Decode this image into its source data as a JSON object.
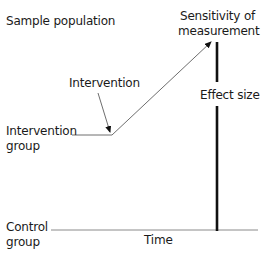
{
  "diagram": {
    "labels": {
      "sample_population": "Sample population",
      "sensitivity_line1": "Sensitivity of",
      "sensitivity_line2": "measurement",
      "intervention": "Intervention",
      "effect_size": "Effect size",
      "intervention_group_line1": "Intervention",
      "intervention_group_line2": "group",
      "control_group_line1": "Control",
      "control_group_line2": "group",
      "time": "Time"
    },
    "colors": {
      "text": "#1a1a1a",
      "thin_line": "#6e6e6e",
      "thick_line": "#111111"
    }
  }
}
